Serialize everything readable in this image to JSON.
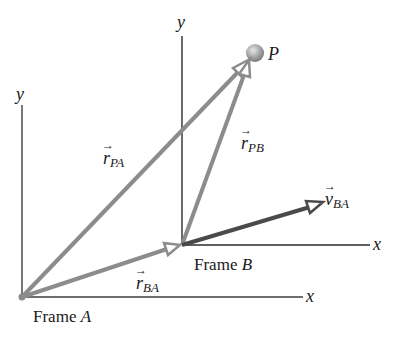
{
  "diagram": {
    "point": {
      "label": "P"
    },
    "frame_a": {
      "label_prefix": "Frame ",
      "label_letter": "A",
      "x_axis": "x",
      "y_axis": "y"
    },
    "frame_b": {
      "label_prefix": "Frame ",
      "label_letter": "B",
      "x_axis": "x",
      "y_axis": "y"
    },
    "vectors": {
      "r_pa": {
        "symbol": "r",
        "subscript": "PA"
      },
      "r_pb": {
        "symbol": "r",
        "subscript": "PB"
      },
      "r_ba": {
        "symbol": "r",
        "subscript": "BA"
      },
      "v_ba": {
        "symbol": "v",
        "subscript": "BA"
      }
    },
    "colors": {
      "axis": "#2b2b2b",
      "position_vector": "#8c8c8c",
      "velocity_vector": "#4a4a4a",
      "point": "#9a9a9a"
    }
  }
}
